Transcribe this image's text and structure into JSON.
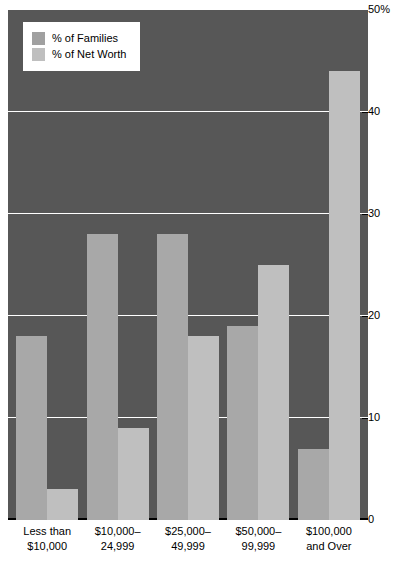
{
  "chart_data": {
    "type": "bar",
    "title": "",
    "subtitle": "",
    "xlabel": "",
    "ylabel": "",
    "ylim": [
      0,
      50
    ],
    "yticks": [
      0,
      10,
      20,
      30,
      40,
      50
    ],
    "ytick_labels": [
      "0",
      "10",
      "20",
      "30",
      "40",
      "50%"
    ],
    "grid": true,
    "legend_position": "top-left",
    "categories": [
      "Less than\n$10,000",
      "$10,000–\n24,999",
      "$25,000–\n49,999",
      "$50,000–\n99,999",
      "$100,000\nand Over"
    ],
    "series": [
      {
        "name": "% of Families",
        "color": "#a8a8a8",
        "values": [
          18,
          28,
          28,
          19,
          7
        ]
      },
      {
        "name": "% of Net Worth",
        "color": "#bfbfbf",
        "values": [
          3,
          9,
          18,
          25,
          44
        ]
      }
    ]
  },
  "legend": {
    "items": [
      {
        "label": "% of Families",
        "swatch": "families-swatch"
      },
      {
        "label": "% of Net Worth",
        "swatch": "networth-swatch"
      }
    ]
  },
  "colors": {
    "plot_background": "#575757",
    "gridline": "#ffffff",
    "baseline": "#000000",
    "series_families": "#a8a8a8",
    "series_networth": "#bfbfbf",
    "page_background": "#ffffff",
    "text": "#000000"
  }
}
